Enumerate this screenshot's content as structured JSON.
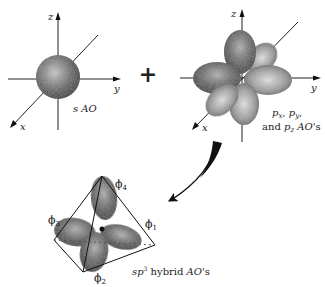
{
  "figure": {
    "operator": "+",
    "s_orbital": {
      "axes": {
        "x": "x",
        "y": "y",
        "z": "z"
      },
      "caption": "s AO"
    },
    "p_orbitals": {
      "axes": {
        "x": "x",
        "y": "y",
        "z": "z"
      },
      "caption_line1": "p",
      "caption_line1_subs": [
        "x",
        "y"
      ],
      "caption_line2_prefix": "and p",
      "caption_line2_sub": "z",
      "caption_line2_suffix": " AO's"
    },
    "hybrid": {
      "orbitals": [
        {
          "symbol": "ϕ",
          "sub": "1"
        },
        {
          "symbol": "ϕ",
          "sub": "2"
        },
        {
          "symbol": "ϕ",
          "sub": "3"
        },
        {
          "symbol": "ϕ",
          "sub": "4"
        }
      ],
      "caption_prefix": "sp",
      "caption_sup": "3",
      "caption_suffix": " hybrid ",
      "caption_italic": "AO",
      "caption_end": "'s"
    }
  }
}
